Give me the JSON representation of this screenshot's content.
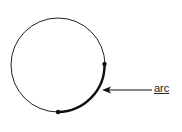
{
  "diagram": {
    "label": "arc",
    "circle": {
      "cx": 58,
      "cy": 65,
      "r": 47,
      "stroke": "#222222"
    },
    "arc": {
      "start_angle_deg": 0,
      "end_angle_deg": 90
    },
    "arrow": {
      "from": [
        152,
        90
      ],
      "to": [
        103,
        90
      ]
    }
  }
}
